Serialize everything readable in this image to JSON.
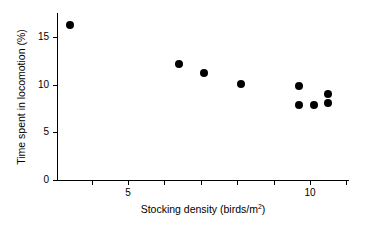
{
  "chart_data": {
    "type": "scatter",
    "title": "",
    "xlabel": "Stocking density (birds/m2)",
    "xlabel_base": "Stocking density (birds/m",
    "xlabel_sup": "2",
    "xlabel_tail": ")",
    "ylabel": "Time spent in locomotion (%)",
    "xlim": [
      2.7,
      11.0
    ],
    "ylim": [
      0,
      17.5
    ],
    "grid": false,
    "legend": null,
    "marker": {
      "shape": "circle",
      "color": "#000000",
      "size_px": 8
    },
    "x_ticks_major": [
      5,
      10
    ],
    "x_tick_labels": [
      "5",
      "10"
    ],
    "x_ticks_minor": [
      3,
      4,
      5,
      6,
      7,
      8,
      9,
      10,
      11
    ],
    "y_ticks_major": [
      0,
      5,
      10,
      15
    ],
    "y_tick_labels": [
      "0",
      "5",
      "10",
      "15"
    ],
    "points": [
      {
        "x": 3.4,
        "y": 16.3
      },
      {
        "x": 6.4,
        "y": 12.2
      },
      {
        "x": 7.1,
        "y": 11.2
      },
      {
        "x": 8.1,
        "y": 10.1
      },
      {
        "x": 9.7,
        "y": 9.9
      },
      {
        "x": 9.7,
        "y": 7.9
      },
      {
        "x": 10.1,
        "y": 7.9
      },
      {
        "x": 10.5,
        "y": 9.0
      },
      {
        "x": 10.5,
        "y": 8.1
      }
    ]
  },
  "geometry": {
    "x_axis_px": {
      "left": 57,
      "right": 349,
      "y": 180
    },
    "y_axis_px": {
      "top": 13,
      "bottom": 180,
      "x": 57
    },
    "x_scale": {
      "value_at_px": 5,
      "px": 128,
      "px_per_unit": 36.4
    },
    "y_scale": {
      "value_at_px": 0,
      "px": 180,
      "px_per_unit": 9.53
    }
  }
}
